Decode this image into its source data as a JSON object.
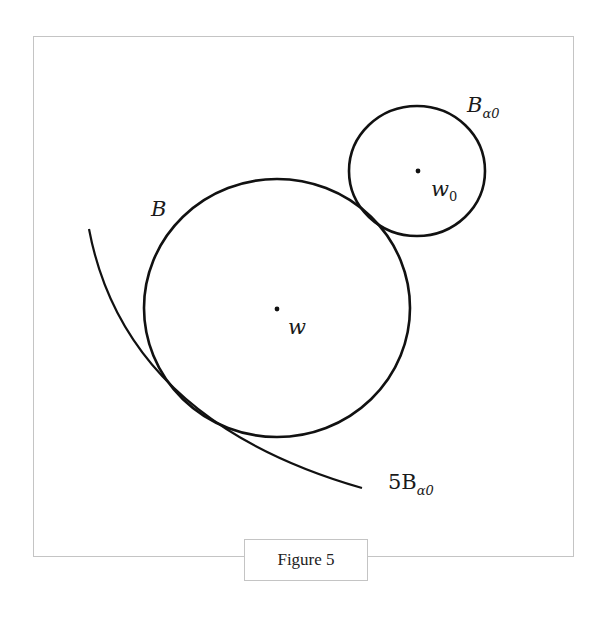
{
  "figure": {
    "caption": "Figure 5",
    "labels": {
      "big_ball": "B",
      "big_center": "w",
      "small_ball_main": "B",
      "small_ball_sub": "α0",
      "small_center_main": "w",
      "small_center_sub": "0",
      "scaled_ball_prefix": "5B",
      "scaled_ball_sub": "α0"
    },
    "colors": {
      "stroke": "#111111",
      "frame": "#c4c4c4"
    }
  }
}
